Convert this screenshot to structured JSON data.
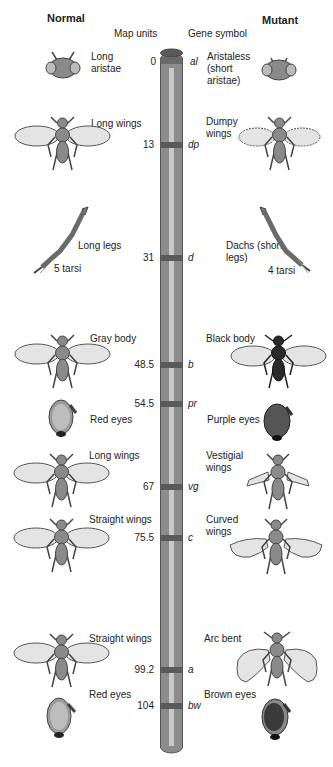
{
  "headers": {
    "normal": "Normal",
    "mutant": "Mutant",
    "map_units": "Map units",
    "gene_symbol": "Gene symbol"
  },
  "colors": {
    "chromosome": "#8c8c8c",
    "chromosome_stripe": "#c8c8c8",
    "band": "#5a5a5a",
    "fly_body": "#8a8a8a",
    "fly_wing": "#e4e4e4",
    "black_body": "#2a2a2a",
    "brown_eye": "#3a3a3a",
    "purple_eye": "#555555",
    "red_eye": "#bdbdbd"
  },
  "loci": [
    {
      "map_units": "0",
      "symbol": "al",
      "normal": "Long aristae",
      "mutant": "Aristaless (short aristae)",
      "normal_icon": "fly-head-long-aristae-icon",
      "mutant_icon": "fly-head-short-aristae-icon"
    },
    {
      "map_units": "13",
      "symbol": "dp",
      "normal": "Long wings",
      "mutant": "Dumpy wings",
      "normal_icon": "fly-long-wings-icon",
      "mutant_icon": "fly-dumpy-wings-icon"
    },
    {
      "map_units": "31",
      "symbol": "d",
      "normal": "Long legs",
      "mutant": "Dachs (short legs)",
      "normal_note": "5 tarsi",
      "mutant_note": "4 tarsi",
      "normal_icon": "long-leg-icon",
      "mutant_icon": "short-leg-icon"
    },
    {
      "map_units": "48.5",
      "symbol": "b",
      "normal": "Gray body",
      "mutant": "Black body",
      "normal_icon": "fly-gray-body-icon",
      "mutant_icon": "fly-black-body-icon"
    },
    {
      "map_units": "54.5",
      "symbol": "pr",
      "normal": "Red eyes",
      "mutant": "Purple eyes",
      "normal_icon": "red-eye-icon",
      "mutant_icon": "purple-eye-icon"
    },
    {
      "map_units": "67",
      "symbol": "vg",
      "normal": "Long wings",
      "mutant": "Vestigial wings",
      "normal_icon": "fly-long-wings-icon",
      "mutant_icon": "fly-vestigial-wings-icon"
    },
    {
      "map_units": "75.5",
      "symbol": "c",
      "normal": "Straight wings",
      "mutant": "Curved wings",
      "normal_icon": "fly-straight-wings-icon",
      "mutant_icon": "fly-curved-wings-icon"
    },
    {
      "map_units": "99.2",
      "symbol": "a",
      "normal": "Straight wings",
      "mutant": "Arc bent",
      "normal_icon": "fly-straight-wings-icon",
      "mutant_icon": "fly-arc-bent-icon"
    },
    {
      "map_units": "104",
      "symbol": "bw",
      "normal": "Red eyes",
      "mutant": "Brown eyes",
      "normal_icon": "red-eye-icon",
      "mutant_icon": "brown-eye-icon"
    }
  ]
}
